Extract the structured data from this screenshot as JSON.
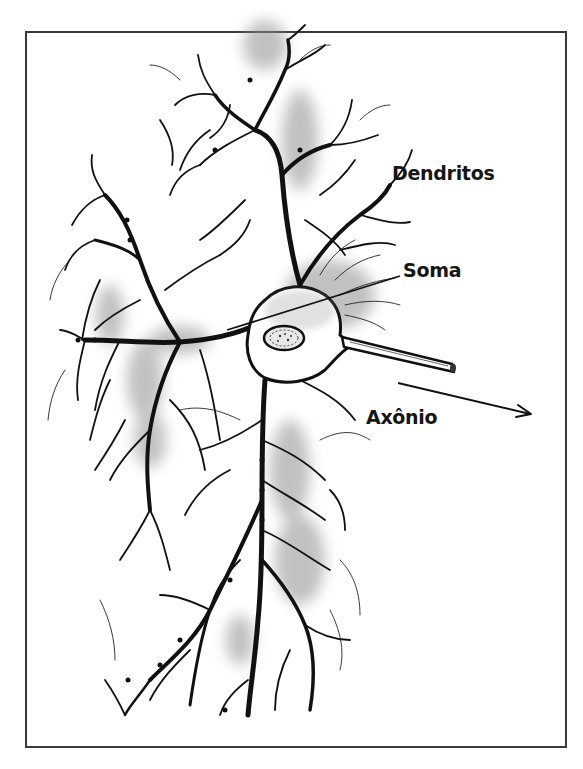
{
  "figure": {
    "type": "neuron-illustration",
    "style": "black ink drawing with grey shading",
    "labels": {
      "dendritos": "Dendritos",
      "soma": "Soma",
      "axonio": "Axônio"
    },
    "parts": [
      {
        "name": "dendrites",
        "label": "Dendritos"
      },
      {
        "name": "soma",
        "label": "Soma"
      },
      {
        "name": "axon",
        "label": "Axônio"
      },
      {
        "name": "nucleus",
        "label": ""
      }
    ],
    "colors": {
      "ink": "#111111",
      "shade": "#9a9a9a",
      "frame": "#3a3a3a",
      "background": "#ffffff"
    }
  }
}
